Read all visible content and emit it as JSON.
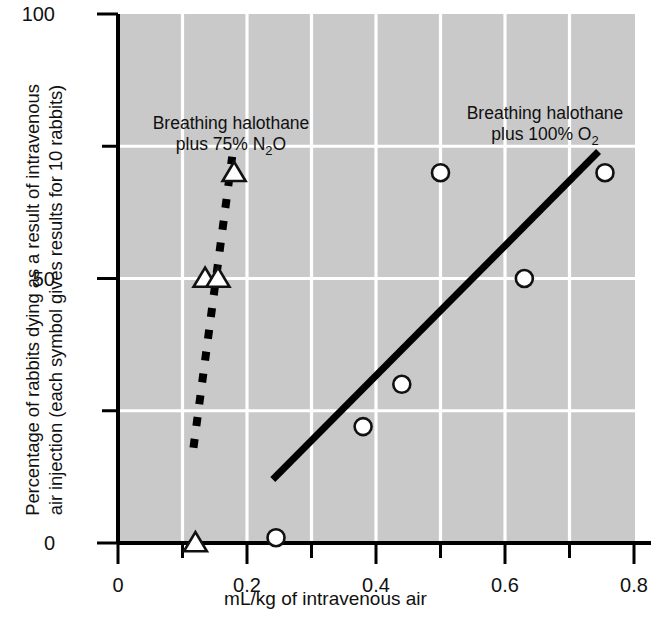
{
  "figure": {
    "background": "#ffffff",
    "plot_background": "#c9c9c9",
    "grid_color": "#ffffff",
    "axis_color": "#000000",
    "marker_fill": "#ffffff",
    "marker_stroke": "#111111"
  },
  "axes": {
    "x_label": "mL/kg of intravenous air",
    "x_ticks": [
      "0",
      "0.2",
      "0.4",
      "0.6",
      "0.8"
    ],
    "x_tick_values": [
      0,
      0.2,
      0.4,
      0.6,
      0.8
    ],
    "x_minor_tick_values": [
      0.1,
      0.3,
      0.5,
      0.7
    ],
    "y_label_line1": "Percentage of rabbits dying as a result of intravenous",
    "y_label_line2": "air injection (each symbol gives results for 10 rabbits)",
    "y_ticks": [
      "0",
      "50",
      "100"
    ],
    "y_tick_values": [
      0,
      50,
      100
    ],
    "y_minor_tick_values": [
      25,
      75
    ]
  },
  "annotations": {
    "left": {
      "line1": "Breathing halothane",
      "line2_pre": "plus 75% N",
      "line2_sub": "2",
      "line2_post": "O"
    },
    "right": {
      "line1": "Breathing halothane",
      "line2_pre": "plus 100% O",
      "line2_sub": "2"
    }
  },
  "chart_data": {
    "type": "scatter",
    "title": "",
    "xlabel": "mL/kg of intravenous air",
    "ylabel": "Percentage of rabbits dying as a result of intravenous air injection (each symbol gives results for 10 rabbits)",
    "xlim": [
      0,
      0.8
    ],
    "ylim": [
      0,
      100
    ],
    "grid": true,
    "legend_position": "inline-annotations",
    "series": [
      {
        "name": "Breathing halothane plus 75% N2O",
        "marker": "triangle",
        "line_style": "dashed",
        "points": [
          {
            "x": 0.12,
            "y": 0
          },
          {
            "x": 0.135,
            "y": 50
          },
          {
            "x": 0.155,
            "y": 50
          },
          {
            "x": 0.18,
            "y": 70
          }
        ],
        "fit_line": {
          "x1": 0.117,
          "y1": 18,
          "x2": 0.177,
          "y2": 73
        }
      },
      {
        "name": "Breathing halothane plus 100% O2",
        "marker": "circle",
        "line_style": "solid",
        "points": [
          {
            "x": 0.245,
            "y": 1
          },
          {
            "x": 0.38,
            "y": 22
          },
          {
            "x": 0.44,
            "y": 30
          },
          {
            "x": 0.5,
            "y": 70
          },
          {
            "x": 0.63,
            "y": 50
          },
          {
            "x": 0.755,
            "y": 70
          }
        ],
        "fit_line": {
          "x1": 0.24,
          "y1": 12,
          "x2": 0.745,
          "y2": 74
        }
      }
    ]
  }
}
